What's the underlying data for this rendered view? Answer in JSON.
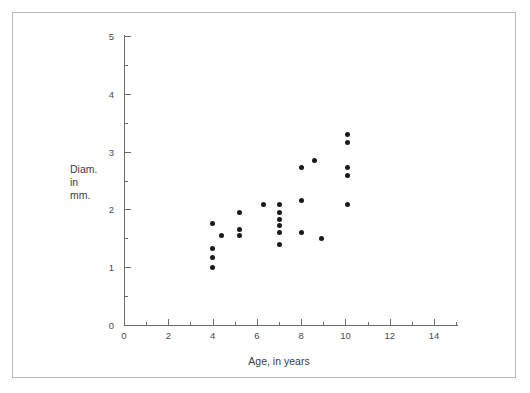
{
  "chart_data": {
    "type": "scatter",
    "title": "",
    "xlabel": "Age, in years",
    "ylabel_lines": [
      "Diam.",
      "in",
      "mm."
    ],
    "ylabel": "Diam. in mm.",
    "xlim": [
      0,
      15
    ],
    "ylim": [
      0,
      5
    ],
    "xticks": [
      0,
      2,
      4,
      6,
      8,
      10,
      12,
      14
    ],
    "xtick_labels": [
      "0",
      "2",
      "4",
      "6",
      "8",
      "10",
      "12",
      "14"
    ],
    "xminor_ticks": [
      1,
      3,
      5,
      7,
      9,
      11,
      13
    ],
    "yticks": [
      0,
      1,
      2,
      3,
      4,
      5
    ],
    "ytick_labels": [
      "0",
      "1",
      "2",
      "3",
      "4",
      "5"
    ],
    "yminor_ticks": [
      0.5,
      1.5,
      2.5,
      3.5,
      4.5
    ],
    "grid": false,
    "legend": null,
    "marker": "filled-circle",
    "marker_color": "#1a1a1a",
    "points": [
      {
        "x": 4.0,
        "y": 1.75
      },
      {
        "x": 4.0,
        "y": 1.33
      },
      {
        "x": 4.0,
        "y": 1.16
      },
      {
        "x": 4.0,
        "y": 1.0
      },
      {
        "x": 4.4,
        "y": 1.55
      },
      {
        "x": 5.2,
        "y": 1.95
      },
      {
        "x": 5.2,
        "y": 1.66
      },
      {
        "x": 5.2,
        "y": 1.54
      },
      {
        "x": 6.3,
        "y": 2.08
      },
      {
        "x": 7.0,
        "y": 2.08
      },
      {
        "x": 7.0,
        "y": 1.95
      },
      {
        "x": 7.0,
        "y": 1.83
      },
      {
        "x": 7.0,
        "y": 1.72
      },
      {
        "x": 7.0,
        "y": 1.6
      },
      {
        "x": 7.0,
        "y": 1.4
      },
      {
        "x": 8.0,
        "y": 2.73
      },
      {
        "x": 8.0,
        "y": 2.16
      },
      {
        "x": 8.0,
        "y": 1.6
      },
      {
        "x": 8.6,
        "y": 2.85
      },
      {
        "x": 8.9,
        "y": 1.5
      },
      {
        "x": 10.1,
        "y": 3.3
      },
      {
        "x": 10.1,
        "y": 3.15
      },
      {
        "x": 10.1,
        "y": 2.72
      },
      {
        "x": 10.1,
        "y": 2.58
      },
      {
        "x": 10.1,
        "y": 2.08
      }
    ]
  },
  "figure": {
    "border_color": "#b8b8b8",
    "axis_color": "#6b6b6b",
    "background": "#ffffff"
  }
}
